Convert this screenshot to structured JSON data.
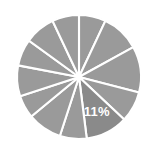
{
  "chart_data": {
    "type": "pie",
    "title": "",
    "subtitle": "",
    "xlabel": "",
    "ylabel": "",
    "grid": false,
    "legend_position": "none",
    "background_color": "#ffffff",
    "divider_color": "#ffffff",
    "label_text_color": "#ffffff",
    "start_angle_deg": -90,
    "direction": "clockwise",
    "center": {
      "x": 79,
      "y": 77
    },
    "radius": 62,
    "labels": [
      "Segment 1",
      "Segment 2",
      "Segment 3",
      "Segment 4",
      "Segment 5",
      "Segment 6",
      "Segment 7",
      "Segment 8",
      "Segment 9",
      "Segment 10",
      "Segment 11",
      "Segment 12"
    ],
    "values": [
      7,
      10,
      12,
      8,
      11,
      7,
      9,
      6,
      8,
      7,
      8,
      7
    ],
    "percentages": [
      7,
      10,
      12,
      8,
      11,
      7,
      9,
      6,
      8,
      7,
      8,
      7
    ],
    "colors": [
      "#9a9a9a",
      "#9a9a9a",
      "#9a9a9a",
      "#9a9a9a",
      "#8a8a8a",
      "#9a9a9a",
      "#9a9a9a",
      "#9a9a9a",
      "#9a9a9a",
      "#9a9a9a",
      "#9a9a9a",
      "#9a9a9a"
    ],
    "highlighted_index": 4,
    "highlight_color": "#8a8a8a",
    "base_color": "#9a9a9a",
    "visible_labels": [
      {
        "index": 4,
        "text": "11%"
      }
    ],
    "annotations": []
  },
  "chart": {
    "highlight_label": "11%"
  }
}
